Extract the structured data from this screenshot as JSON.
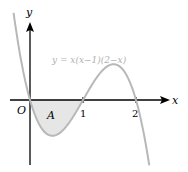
{
  "figure": {
    "equation": "y = x(x−1)(2−x)",
    "axis_x_label": "x",
    "axis_y_label": "y",
    "origin_label": "O",
    "region_label": "A",
    "tick_1": "1",
    "tick_2": "2",
    "colors": {
      "axes": "#000000",
      "curve": "#b8b8b8",
      "shade": "#e6e6e6",
      "equation_text": "#b0b0b0"
    }
  }
}
